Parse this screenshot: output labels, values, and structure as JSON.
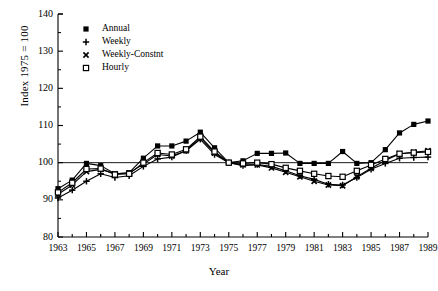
{
  "chart_data": {
    "type": "line",
    "title": "",
    "xlabel": "Year",
    "ylabel": "Index 1975 = 100",
    "xlim": [
      1963,
      1989
    ],
    "ylim": [
      80,
      140
    ],
    "ytick_values": [
      80,
      90,
      100,
      110,
      120,
      130,
      140
    ],
    "ytick_labels": [
      "80",
      "90",
      "100",
      "110",
      "120",
      "130",
      "140"
    ],
    "y_minor_step": 5,
    "xtick_values": [
      1963,
      1965,
      1967,
      1969,
      1971,
      1973,
      1975,
      1977,
      1979,
      1981,
      1983,
      1985,
      1987,
      1989
    ],
    "xtick_labels": [
      "1963",
      "1965",
      "1967",
      "1969",
      "1971",
      "1973",
      "1975",
      "1977",
      "1979",
      "1981",
      "1983",
      "1985",
      "1987",
      "1989"
    ],
    "x_minor_step": 1,
    "grid": false,
    "reference_line": 100,
    "legend_position": "upper-left-inside",
    "x": [
      1963,
      1964,
      1965,
      1966,
      1967,
      1968,
      1969,
      1970,
      1971,
      1972,
      1973,
      1974,
      1975,
      1976,
      1977,
      1978,
      1979,
      1980,
      1981,
      1982,
      1983,
      1984,
      1985,
      1986,
      1987,
      1988,
      1989
    ],
    "series": [
      {
        "name": "Annual",
        "marker": "filled-square",
        "values": [
          93.0,
          95.3,
          99.8,
          99.2,
          97.0,
          97.3,
          101.2,
          104.5,
          104.5,
          105.8,
          108.2,
          104.0,
          100.0,
          100.5,
          102.5,
          102.5,
          102.6,
          99.8,
          99.8,
          99.8,
          103.0,
          99.8,
          100.0,
          103.5,
          108.0,
          110.3,
          111.2
        ]
      },
      {
        "name": "Weekly",
        "marker": "plus",
        "values": [
          90.5,
          92.6,
          95.0,
          97.0,
          96.0,
          96.5,
          99.0,
          101.0,
          101.5,
          103.2,
          106.3,
          102.2,
          100.0,
          99.2,
          99.5,
          99.0,
          97.8,
          96.5,
          95.5,
          94.2,
          94.0,
          96.0,
          98.2,
          99.8,
          101.2,
          101.4,
          101.5
        ]
      },
      {
        "name": "Weekly-Constnt",
        "marker": "cross",
        "values": [
          91.5,
          94.0,
          97.6,
          98.2,
          97.0,
          97.2,
          99.6,
          102.2,
          101.8,
          103.2,
          106.8,
          102.6,
          100.0,
          99.4,
          99.4,
          98.6,
          97.4,
          96.2,
          95.0,
          94.0,
          93.8,
          96.2,
          98.5,
          100.6,
          102.4,
          102.8,
          103.2
        ]
      },
      {
        "name": "Hourly",
        "marker": "open-square",
        "values": [
          92.0,
          94.6,
          98.3,
          98.4,
          96.8,
          97.0,
          100.0,
          102.6,
          102.2,
          103.6,
          107.0,
          103.0,
          100.0,
          99.8,
          100.0,
          99.6,
          98.6,
          97.8,
          97.0,
          96.4,
          96.2,
          97.8,
          99.4,
          101.0,
          102.4,
          102.7,
          102.9
        ]
      }
    ]
  },
  "legend": {
    "items": [
      {
        "label": "Annual"
      },
      {
        "label": "Weekly"
      },
      {
        "label": "Weekly-Constnt"
      },
      {
        "label": "Hourly"
      }
    ]
  },
  "colors": {
    "line": "#000000",
    "axis": "#000000",
    "background": "#ffffff"
  }
}
